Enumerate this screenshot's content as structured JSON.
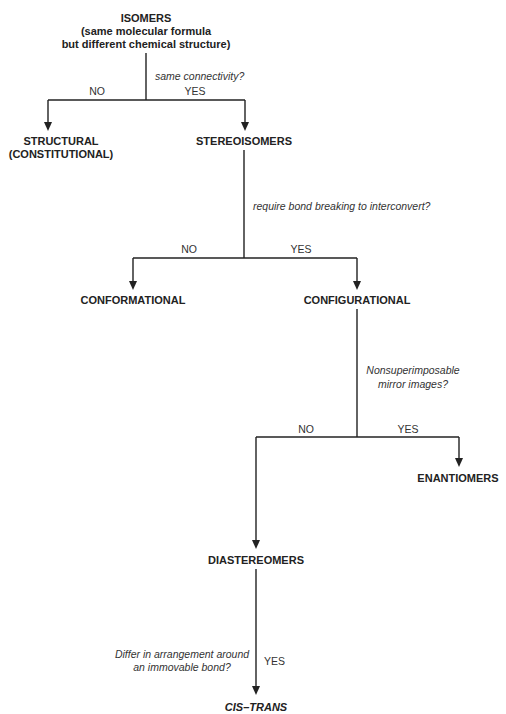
{
  "diagram": {
    "colors": {
      "line": "#222222",
      "text": "#222222",
      "question": "#333333",
      "background": "#ffffff"
    },
    "root": {
      "label": "ISOMERS",
      "subtitle_line1": "(same molecular formula",
      "subtitle_line2": "but different chemical structure)"
    },
    "q1": {
      "question": "same connectivity?",
      "no": "NO",
      "yes": "YES"
    },
    "structural": {
      "line1": "STRUCTURAL",
      "line2": "(CONSTITUTIONAL)"
    },
    "stereoisomers": {
      "label": "STEREOISOMERS"
    },
    "q2": {
      "question": "require bond breaking to interconvert?",
      "no": "NO",
      "yes": "YES"
    },
    "conformational": {
      "label": "CONFORMATIONAL"
    },
    "configurational": {
      "label": "CONFIGURATIONAL"
    },
    "q3": {
      "question_line1": "Nonsuperimposable",
      "question_line2": "mirror images?",
      "no": "NO",
      "yes": "YES"
    },
    "enantiomers": {
      "label": "ENANTIOMERS"
    },
    "diastereomers": {
      "label": "DIASTEREOMERS"
    },
    "q4": {
      "question_line1": "Differ in arrangement around",
      "question_line2": "an immovable bond?",
      "yes": "YES"
    },
    "cis_trans": {
      "label": "CIS–TRANS"
    }
  }
}
